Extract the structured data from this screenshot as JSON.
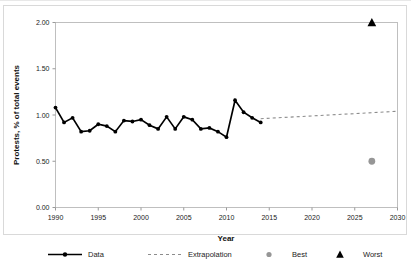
{
  "chart_data": {
    "type": "line",
    "title": "",
    "xlabel": "Year",
    "ylabel": "Protests, % of total events",
    "xlim": [
      1990,
      2030
    ],
    "ylim": [
      0.0,
      2.0
    ],
    "xticks": [
      1990,
      1995,
      2000,
      2005,
      2010,
      2015,
      2020,
      2025,
      2030
    ],
    "xtick_labels": [
      "1990",
      "1995",
      "2000",
      "2005",
      "2010",
      "2015",
      "2020",
      "2025",
      "2030"
    ],
    "yticks": [
      0.0,
      0.5,
      1.0,
      1.5,
      2.0
    ],
    "ytick_labels": [
      "0.00",
      "0.50",
      "1.00",
      "1.50",
      "2.00"
    ],
    "grid": false,
    "legend_position": "bottom",
    "series": [
      {
        "name": "Data",
        "type": "line-marker",
        "color": "#000000",
        "marker": "circle",
        "x": [
          1990,
          1991,
          1992,
          1993,
          1994,
          1995,
          1996,
          1997,
          1998,
          1999,
          2000,
          2001,
          2002,
          2003,
          2004,
          2005,
          2006,
          2007,
          2008,
          2009,
          2010,
          2011,
          2012,
          2013,
          2014
        ],
        "values": [
          1.08,
          0.92,
          0.97,
          0.82,
          0.83,
          0.9,
          0.88,
          0.82,
          0.94,
          0.93,
          0.95,
          0.89,
          0.85,
          0.98,
          0.85,
          0.98,
          0.95,
          0.85,
          0.86,
          0.82,
          0.76,
          1.16,
          1.03,
          0.97,
          0.92
        ]
      },
      {
        "name": "Extrapolation",
        "type": "dashed-line",
        "color": "#8c8c8c",
        "x": [
          2014,
          2030
        ],
        "values": [
          0.96,
          1.04
        ]
      },
      {
        "name": "Best",
        "type": "point",
        "color": "#969696",
        "marker": "circle",
        "x": [
          2027
        ],
        "values": [
          0.5
        ]
      },
      {
        "name": "Worst",
        "type": "point",
        "color": "#000000",
        "marker": "triangle",
        "x": [
          2027
        ],
        "values": [
          2.0
        ]
      }
    ],
    "legend": [
      {
        "label": "Data",
        "marker": "line-circle",
        "color": "#000000"
      },
      {
        "label": "Extrapolation",
        "marker": "dashed-line",
        "color": "#8c8c8c"
      },
      {
        "label": "Best",
        "marker": "circle",
        "color": "#969696"
      },
      {
        "label": "Worst",
        "marker": "triangle",
        "color": "#000000"
      }
    ]
  }
}
